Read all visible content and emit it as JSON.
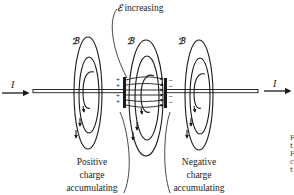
{
  "diagram": {
    "title_label": {
      "symbol": "ℰ",
      "text": " increasing"
    },
    "current_labels": {
      "left": "I",
      "right": "I"
    },
    "field_labels": [
      "ℬ",
      "ℬ",
      "ℬ"
    ],
    "positive_label": {
      "line1": "Positive",
      "line2": "charge",
      "line3": "accumulating"
    },
    "negative_label": {
      "line1": "Negative",
      "line2": "charge",
      "line3": "accumulating"
    },
    "plate_charges": {
      "positive": "+",
      "negative": "–"
    },
    "caption_fragments": [
      "F",
      "t",
      "F",
      "c",
      "t"
    ],
    "colors": {
      "ink": "#1a1a1a",
      "background": "#ffffff"
    }
  }
}
